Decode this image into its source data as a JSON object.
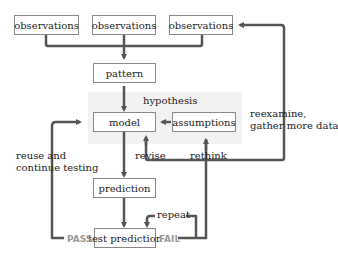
{
  "diagram": {
    "nodes": {
      "obs1": "observations",
      "obs2": "observations",
      "obs3": "observations",
      "pattern": "pattern",
      "model": "model",
      "assumptions": "assumptions",
      "prediction": "prediction",
      "test": "test prediction"
    },
    "labels": {
      "hypothesis": "hypothesis",
      "reexamine1": "reexamine,",
      "reexamine2": "gather more data",
      "reuse1": "reuse and",
      "reuse2": "continue testing",
      "revise": "revise",
      "rethink": "rethink",
      "repeat": "repeat",
      "pass": "PASS",
      "fail": "FAIL"
    },
    "colors": {
      "arrow": "#555555",
      "box_border": "#8a8a8a",
      "shade": "#f2f2f2",
      "pass_fail": "#9a9a9a"
    }
  }
}
